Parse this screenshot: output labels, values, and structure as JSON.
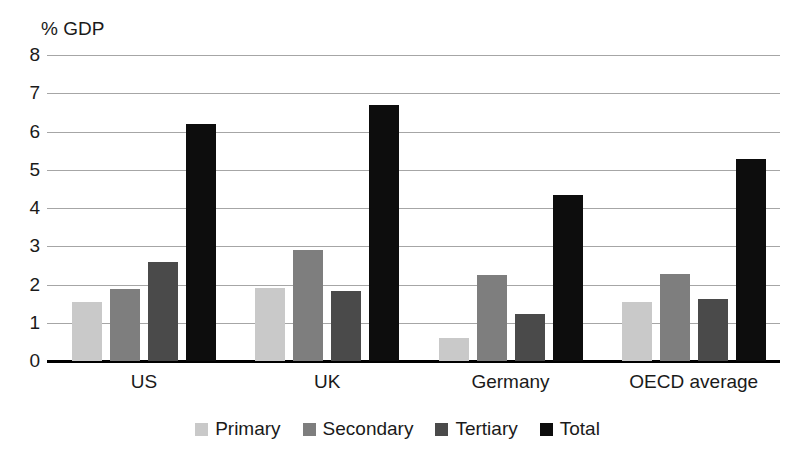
{
  "chart_data": {
    "type": "bar",
    "title": "",
    "ylabel": "% GDP",
    "xlabel": "",
    "ylim": [
      0,
      8
    ],
    "yticks": [
      0,
      1,
      2,
      3,
      4,
      5,
      6,
      7,
      8
    ],
    "grid": true,
    "legend_position": "bottom",
    "categories": [
      "US",
      "UK",
      "Germany",
      "OECD average"
    ],
    "series": [
      {
        "name": "Primary",
        "color": "#c9c9c9",
        "values": [
          1.55,
          1.9,
          0.6,
          1.55
        ]
      },
      {
        "name": "Secondary",
        "color": "#7e7e7e",
        "values": [
          1.88,
          2.9,
          2.25,
          2.27
        ]
      },
      {
        "name": "Tertiary",
        "color": "#4a4a4a",
        "values": [
          2.6,
          1.83,
          1.22,
          1.63
        ]
      },
      {
        "name": "Total",
        "color": "#0d0d0d",
        "values": [
          6.2,
          6.7,
          4.35,
          5.27
        ]
      }
    ]
  },
  "axis": {
    "y_title": "% GDP",
    "tick_8": "8",
    "tick_7": "7",
    "tick_6": "6",
    "tick_5": "5",
    "tick_4": "4",
    "tick_3": "3",
    "tick_2": "2",
    "tick_1": "1",
    "tick_0": "0"
  },
  "categories": {
    "c0": "US",
    "c1": "UK",
    "c2": "Germany",
    "c3": "OECD average"
  },
  "legend": {
    "primary": "Primary",
    "secondary": "Secondary",
    "tertiary": "Tertiary",
    "total": "Total"
  }
}
